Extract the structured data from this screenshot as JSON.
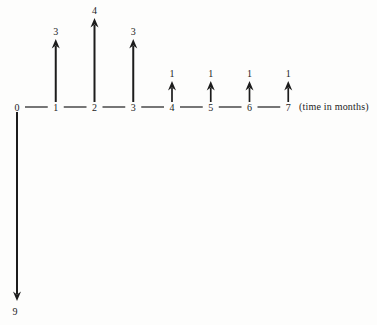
{
  "figure": {
    "kind": "cash-flow-diagram",
    "background": "#fdfdfc",
    "ink": "#1c1c1c"
  },
  "chart_data": {
    "type": "cash-flow-timeline",
    "time_axis": {
      "ticks": [
        "0",
        "1",
        "2",
        "3",
        "4",
        "5",
        "6",
        "7"
      ],
      "label": "(time in months)"
    },
    "flows": [
      {
        "time": 0,
        "amount": 9,
        "label": "9",
        "direction": "down"
      },
      {
        "time": 1,
        "amount": 3,
        "label": "3",
        "direction": "up"
      },
      {
        "time": 2,
        "amount": 4,
        "label": "4",
        "direction": "up"
      },
      {
        "time": 3,
        "amount": 3,
        "label": "3",
        "direction": "up"
      },
      {
        "time": 4,
        "amount": 1,
        "label": "1",
        "direction": "up"
      },
      {
        "time": 5,
        "amount": 1,
        "label": "1",
        "direction": "up"
      },
      {
        "time": 6,
        "amount": 1,
        "label": "1",
        "direction": "up"
      },
      {
        "time": 7,
        "amount": 1,
        "label": "1",
        "direction": "up"
      }
    ]
  }
}
